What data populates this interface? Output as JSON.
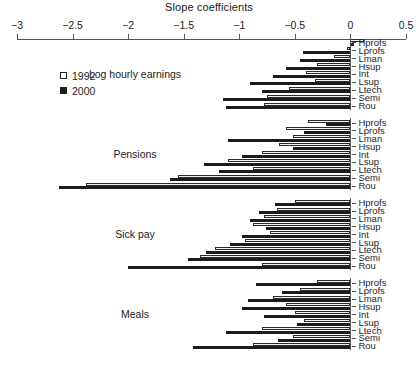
{
  "chart_data": {
    "type": "bar",
    "orientation": "horizontal",
    "title": "Slope coefficients",
    "xlabel": "Slope coefficients",
    "ylabel": "",
    "xlim": [
      -3,
      0.5
    ],
    "xticks": [
      -3,
      -2.5,
      -2,
      -1.5,
      -1,
      -0.5,
      0,
      0.5
    ],
    "xticklabels": [
      "−3",
      "−2.5",
      "−2",
      "−1.5",
      "−1",
      "−0.5",
      "0",
      "0.5"
    ],
    "grid": false,
    "legend": {
      "position": "upper-left-inside",
      "entries": [
        {
          "name": "1992",
          "marker": "open-square"
        },
        {
          "name": "2000",
          "marker": "filled-square"
        }
      ]
    },
    "categories": [
      "Hprofs",
      "Lprofs",
      "Lman",
      "Hsup",
      "Int",
      "Lsup",
      "Ltech",
      "Semi",
      "Rou"
    ],
    "panels": [
      {
        "label": "Log hourly earnings",
        "series": [
          {
            "name": "1992",
            "values": [
              0.12,
              -0.03,
              -0.15,
              -0.3,
              -0.4,
              -0.32,
              -0.55,
              -0.75,
              -0.78
            ]
          },
          {
            "name": "2000",
            "values": [
              0.03,
              -0.43,
              -0.45,
              -0.58,
              -0.7,
              -0.9,
              -0.8,
              -1.15,
              -1.12
            ]
          }
        ]
      },
      {
        "label": "Pensions",
        "series": [
          {
            "name": "1992",
            "values": [
              -0.38,
              -0.58,
              -0.52,
              -0.64,
              -0.8,
              -1.1,
              -0.88,
              -1.55,
              -2.38
            ]
          },
          {
            "name": "2000",
            "values": [
              -0.22,
              -0.42,
              -1.1,
              -0.52,
              -0.98,
              -1.32,
              -1.18,
              -1.62,
              -2.62
            ]
          }
        ]
      },
      {
        "label": "Sick pay",
        "series": [
          {
            "name": "1992",
            "values": [
              -0.5,
              -0.66,
              -0.78,
              -0.88,
              -0.72,
              -0.95,
              -1.22,
              -1.35,
              -0.8
            ]
          },
          {
            "name": "2000",
            "values": [
              -0.68,
              -0.82,
              -0.9,
              -0.76,
              -0.98,
              -1.08,
              -1.3,
              -1.46,
              -2.0
            ]
          }
        ]
      },
      {
        "label": "Meals",
        "series": [
          {
            "name": "1992",
            "values": [
              -0.3,
              -0.45,
              -0.7,
              -0.58,
              -0.5,
              -0.42,
              -0.8,
              -0.52,
              -0.88
            ]
          },
          {
            "name": "2000",
            "values": [
              -0.85,
              -0.62,
              -0.92,
              -0.98,
              -0.78,
              -0.48,
              -1.12,
              -0.65,
              -1.42
            ]
          }
        ]
      }
    ]
  }
}
